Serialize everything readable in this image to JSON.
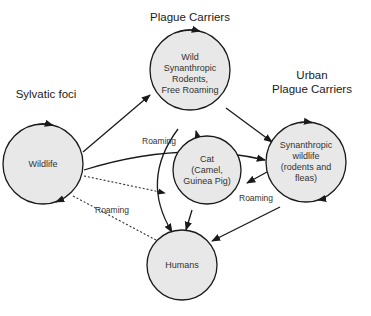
{
  "headings": {
    "plague_carriers": "Plague Carriers",
    "sylvatic_foci": "Sylvatic foci",
    "urban_line1": "Urban",
    "urban_line2": "Plague Carriers"
  },
  "nodes": {
    "wild_rodents": [
      "Wild",
      "Synanthropic",
      "Rodents,",
      "Free Roaming"
    ],
    "wildlife": [
      "Wildlife"
    ],
    "synanthropic": [
      "Synanthropic",
      "wildlife",
      "(rodents and",
      "fleas)"
    ],
    "cat": [
      "Cat",
      "(Camel,",
      "Guinea Pig)"
    ],
    "humans": [
      "Humans"
    ]
  },
  "edge_labels": {
    "roaming_1": "Roaming",
    "roaming_2": "Roaming",
    "roaming_3": "Roaming"
  },
  "colors": {
    "node_fill": "#e8e8e8",
    "stroke": "#1a1a1a"
  }
}
